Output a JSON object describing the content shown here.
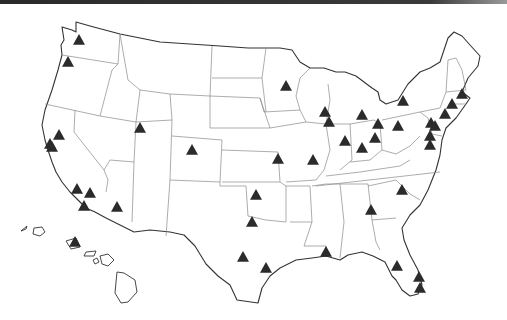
{
  "map": {
    "title": "United States",
    "marker_shape": "triangle",
    "colors": {
      "background": "#ffffff",
      "outline": "#333333",
      "state_border": "#8a8a8a",
      "marker": "#2b2b2b",
      "top_bar": "#2a2a2a"
    },
    "markers": [
      {
        "region": "Washington (Seattle)",
        "x": 79,
        "y": 40
      },
      {
        "region": "Oregon (Portland)",
        "x": 68,
        "y": 62
      },
      {
        "region": "California (Sacramento)",
        "x": 59,
        "y": 135
      },
      {
        "region": "California (San Francisco Bay)",
        "x": 52,
        "y": 147
      },
      {
        "region": "California (Bay Area 2)",
        "x": 50,
        "y": 144
      },
      {
        "region": "California (Los Angeles north)",
        "x": 77,
        "y": 189
      },
      {
        "region": "California (Los Angeles east)",
        "x": 90,
        "y": 193
      },
      {
        "region": "California (San Diego area)",
        "x": 84,
        "y": 206
      },
      {
        "region": "Arizona (Phoenix)",
        "x": 117,
        "y": 207
      },
      {
        "region": "Utah (Salt Lake City)",
        "x": 140,
        "y": 128
      },
      {
        "region": "Colorado (Denver)",
        "x": 192,
        "y": 150
      },
      {
        "region": "Minnesota (Minneapolis)",
        "x": 286,
        "y": 86
      },
      {
        "region": "Wisconsin (Milwaukee)",
        "x": 325,
        "y": 112
      },
      {
        "region": "Illinois (Chicago)",
        "x": 329,
        "y": 122
      },
      {
        "region": "Missouri (Kansas City)",
        "x": 278,
        "y": 159
      },
      {
        "region": "Missouri (St. Louis)",
        "x": 313,
        "y": 160
      },
      {
        "region": "Michigan (Grand Rapids)",
        "x": 362,
        "y": 115
      },
      {
        "region": "Indiana (Indianapolis)",
        "x": 345,
        "y": 141
      },
      {
        "region": "Kentucky (Louisville)",
        "x": 362,
        "y": 148
      },
      {
        "region": "Ohio (Toledo)",
        "x": 378,
        "y": 124
      },
      {
        "region": "Ohio (Columbus)",
        "x": 375,
        "y": 138
      },
      {
        "region": "Pennsylvania (Pittsburgh)",
        "x": 398,
        "y": 126
      },
      {
        "region": "New York (Rochester)",
        "x": 403,
        "y": 101
      },
      {
        "region": "Massachusetts (Boston)",
        "x": 462,
        "y": 94
      },
      {
        "region": "Connecticut (Hartford)",
        "x": 452,
        "y": 104
      },
      {
        "region": "New York (NYC)",
        "x": 445,
        "y": 114
      },
      {
        "region": "New Jersey",
        "x": 431,
        "y": 123
      },
      {
        "region": "Pennsylvania (Philadelphia)",
        "x": 435,
        "y": 126
      },
      {
        "region": "Maryland (Baltimore)",
        "x": 430,
        "y": 136
      },
      {
        "region": "Virginia (Washington DC area)",
        "x": 430,
        "y": 145
      },
      {
        "region": "North Carolina (Raleigh)",
        "x": 402,
        "y": 190
      },
      {
        "region": "Oklahoma (Oklahoma City)",
        "x": 256,
        "y": 195
      },
      {
        "region": "Texas (Dallas)",
        "x": 252,
        "y": 222
      },
      {
        "region": "Texas (San Antonio area)",
        "x": 243,
        "y": 257
      },
      {
        "region": "Texas (Houston)",
        "x": 266,
        "y": 268
      },
      {
        "region": "Louisiana (New Orleans)",
        "x": 326,
        "y": 252
      },
      {
        "region": "Georgia (Atlanta)",
        "x": 371,
        "y": 210
      },
      {
        "region": "Florida (Tampa)",
        "x": 397,
        "y": 266
      },
      {
        "region": "Florida (Fort Lauderdale)",
        "x": 419,
        "y": 277
      },
      {
        "region": "Florida (Miami)",
        "x": 420,
        "y": 288
      },
      {
        "region": "Hawaii (Oahu)",
        "x": 75,
        "y": 242
      }
    ]
  }
}
